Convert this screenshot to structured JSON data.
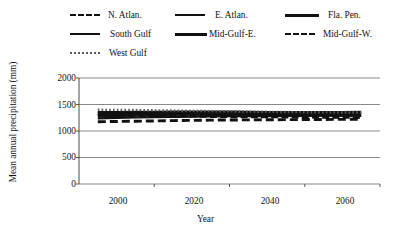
{
  "chart_data": {
    "type": "line",
    "title": "",
    "xlabel": "Year",
    "ylabel": "Mean annual precipitation (mm)",
    "xlim": [
      1990,
      2070
    ],
    "ylim": [
      0,
      2000
    ],
    "xticks": [
      2000,
      2020,
      2040,
      2060
    ],
    "yticks": [
      0,
      500,
      1000,
      1500,
      2000
    ],
    "grid": true,
    "legend_position": "top",
    "x": [
      1995,
      2000,
      2005,
      2010,
      2015,
      2020,
      2025,
      2030,
      2035,
      2040,
      2045,
      2050,
      2055,
      2060,
      2065
    ],
    "series": [
      {
        "name": "N. Atlan.",
        "style": "dashed-large",
        "values": [
          1310,
          1300,
          1295,
          1290,
          1285,
          1280,
          1275,
          1270,
          1270,
          1268,
          1265,
          1262,
          1260,
          1258,
          1255
        ]
      },
      {
        "name": "E. Atlan.",
        "style": "solid-medium",
        "values": [
          1355,
          1358,
          1360,
          1362,
          1365,
          1368,
          1368,
          1365,
          1362,
          1358,
          1355,
          1350,
          1348,
          1345,
          1342
        ]
      },
      {
        "name": "Fla. Pen.",
        "style": "solid-thick",
        "values": [
          1285,
          1292,
          1300,
          1310,
          1320,
          1330,
          1335,
          1338,
          1340,
          1342,
          1344,
          1345,
          1346,
          1348,
          1350
        ]
      },
      {
        "name": "South Gulf",
        "style": "solid-medium",
        "values": [
          1240,
          1248,
          1255,
          1262,
          1268,
          1272,
          1275,
          1278,
          1280,
          1282,
          1284,
          1286,
          1288,
          1290,
          1292
        ]
      },
      {
        "name": "Mid-Gulf-E.",
        "style": "solid-thick",
        "values": [
          1330,
          1330,
          1328,
          1325,
          1322,
          1318,
          1315,
          1312,
          1310,
          1308,
          1305,
          1302,
          1300,
          1298,
          1296
        ]
      },
      {
        "name": "Mid-Gulf-W.",
        "style": "dashed-wide",
        "values": [
          1175,
          1180,
          1185,
          1190,
          1196,
          1200,
          1205,
          1208,
          1210,
          1212,
          1214,
          1216,
          1218,
          1220,
          1222
        ]
      },
      {
        "name": "West Gulf",
        "style": "dotted",
        "values": [
          1400,
          1398,
          1395,
          1390,
          1385,
          1380,
          1375,
          1370,
          1366,
          1362,
          1358,
          1355,
          1352,
          1350,
          1348
        ]
      }
    ]
  },
  "legend": {
    "rows": [
      [
        {
          "label": "N. Atlan.",
          "swatch": "legend-line-dashed-large"
        },
        {
          "label": "E. Atlan.",
          "swatch": "legend-line-solid-medium"
        },
        {
          "label": "Fla. Pen.",
          "swatch": "legend-line-solid-thick"
        }
      ],
      [
        {
          "label": "South Gulf",
          "swatch": "legend-line-solid-medium"
        },
        {
          "label": "Mid-Gulf-E.",
          "swatch": "legend-line-solid-thick"
        },
        {
          "label": "Mid-Gulf-W.",
          "swatch": "legend-line-dashed-wide"
        }
      ],
      [
        {
          "label": "West Gulf",
          "swatch": "legend-line-dotted"
        }
      ]
    ]
  },
  "axes": {
    "y_label": "Mean annual precipitation (mm)",
    "x_label": "Year",
    "y_tick_labels": [
      "2000",
      "1500",
      "1000",
      "500",
      "0"
    ],
    "x_tick_labels": [
      "2000",
      "2020",
      "2040",
      "2060"
    ]
  },
  "colors": {
    "line": "#111111",
    "grid": "#6b6b6b",
    "axis": "#4a4a4a",
    "dotted": "#5b5b5b",
    "background": "#ffffff"
  }
}
